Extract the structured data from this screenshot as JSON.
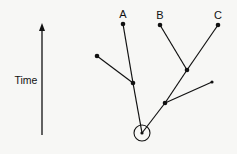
{
  "axis": {
    "label": "Time",
    "x": 42,
    "y_top": 23,
    "y_bottom": 135,
    "label_x": 26,
    "label_y": 84
  },
  "colors": {
    "stroke": "#111111",
    "background": "#f7f7f5"
  },
  "root": {
    "x": 142,
    "y": 133,
    "circle_radius": 8
  },
  "nodes": [
    {
      "id": "root",
      "x": 142,
      "y": 133,
      "r": 1.6
    },
    {
      "id": "junction-left",
      "x": 133,
      "y": 83,
      "r": 2.3
    },
    {
      "id": "leaf-left",
      "x": 97,
      "y": 56,
      "r": 2.3
    },
    {
      "id": "leaf-A",
      "x": 123,
      "y": 24,
      "r": 2.3,
      "label": "A"
    },
    {
      "id": "junction-lower-right",
      "x": 165,
      "y": 103,
      "r": 2.3
    },
    {
      "id": "leaf-short-right",
      "x": 212,
      "y": 82,
      "r": 1.6
    },
    {
      "id": "junction-BC",
      "x": 187,
      "y": 70,
      "r": 2.3
    },
    {
      "id": "leaf-B",
      "x": 160,
      "y": 25,
      "r": 2.3,
      "label": "B"
    },
    {
      "id": "leaf-C",
      "x": 218,
      "y": 25,
      "r": 2.3,
      "label": "C"
    }
  ],
  "edges": [
    [
      "root",
      "junction-left"
    ],
    [
      "junction-left",
      "leaf-A"
    ],
    [
      "junction-left",
      "leaf-left"
    ],
    [
      "root",
      "junction-lower-right"
    ],
    [
      "junction-lower-right",
      "leaf-short-right"
    ],
    [
      "junction-lower-right",
      "junction-BC"
    ],
    [
      "junction-BC",
      "leaf-B"
    ],
    [
      "junction-BC",
      "leaf-C"
    ]
  ],
  "labels": {
    "A": "A",
    "B": "B",
    "C": "C"
  }
}
